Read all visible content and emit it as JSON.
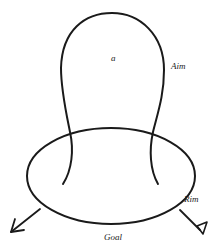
{
  "diagram": {
    "labels": {
      "inner": "a",
      "aim": "Aim",
      "rim": "Rim",
      "goal": "Goal"
    },
    "colors": {
      "stroke": "#1a1a1a",
      "background": "#ffffff"
    },
    "shapes": {
      "bulb_loop": "open loop rising above ellipse, legs crossing ellipse and ending inside",
      "ellipse": "closed horizontal ellipse",
      "left_arrow": "arrow pointing down-left from ellipse",
      "right_marker": "line ending in open triangle pointing down-right"
    }
  }
}
